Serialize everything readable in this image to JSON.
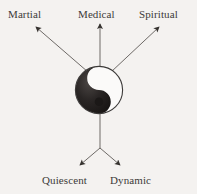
{
  "diagram": {
    "type": "radial-arrow-diagram",
    "title": "",
    "center_symbol": {
      "name": "yin-yang",
      "cx": 99,
      "cy": 90,
      "radius": 24,
      "dark_color": "#231f1e",
      "light_color": "#faf9f8",
      "outline_color": "#3c3a39"
    },
    "background_color": "#f4f2f0",
    "line_color": "#6e6a67",
    "text_color": "#3c3a39",
    "labels": [
      {
        "id": "martial",
        "text": "Martial",
        "direction": "up-left"
      },
      {
        "id": "medical",
        "text": "Medical",
        "direction": "up"
      },
      {
        "id": "spiritual",
        "text": "Spiritual",
        "direction": "up-right"
      },
      {
        "id": "quiescent",
        "text": "Quiescent",
        "direction": "down-left"
      },
      {
        "id": "dynamic",
        "text": "Dynamic",
        "direction": "down-right"
      }
    ],
    "arrows": [
      {
        "id": "arrow-martial",
        "from_x": 88,
        "from_y": 72,
        "to_x": 35,
        "to_y": 26
      },
      {
        "id": "arrow-medical",
        "from_x": 100,
        "from_y": 68,
        "to_x": 100,
        "to_y": 22
      },
      {
        "id": "arrow-spiritual",
        "from_x": 111,
        "from_y": 72,
        "to_x": 160,
        "to_y": 26
      },
      {
        "id": "arrow-stem",
        "from_x": 100,
        "from_y": 110,
        "to_x": 100,
        "to_y": 148
      },
      {
        "id": "arrow-quiescent",
        "from_x": 100,
        "from_y": 148,
        "to_x": 79,
        "to_y": 166
      },
      {
        "id": "arrow-dynamic",
        "from_x": 100,
        "from_y": 148,
        "to_x": 121,
        "to_y": 166
      }
    ]
  }
}
